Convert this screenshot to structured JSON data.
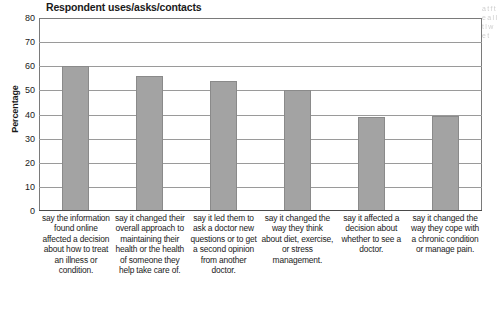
{
  "chart_data": {
    "type": "bar",
    "title": "Respondent uses/asks/contacts",
    "xlabel": "",
    "ylabel": "Percentage",
    "ylim": [
      0,
      80
    ],
    "yticks": [
      80,
      70,
      60,
      50,
      40,
      30,
      20,
      10,
      0
    ],
    "grid": true,
    "legend": null,
    "bar_color": "#a3a3a3",
    "categories": [
      "say the information found online affected a decision about how to treat an illness or condition.",
      "say it changed their overall approach to maintaining their health or the health of someone they help take care of.",
      "say it led them to ask a doctor new questions or to get a second opinion from another doctor.",
      "say it changed the way they think about diet, exercise, or stress management.",
      "say it affected a decision about whether to see a doctor.",
      "say it changed the way they cope with a chronic condition or manage pain."
    ],
    "values": [
      60,
      56,
      54,
      50,
      39,
      39.5
    ]
  },
  "bleed": {
    "text": "a t f t e a l l t l w e t"
  }
}
